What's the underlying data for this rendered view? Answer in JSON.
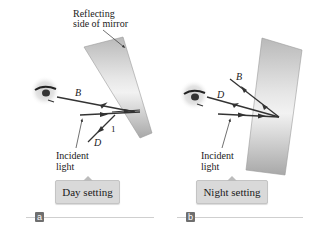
{
  "figure": {
    "panels": [
      {
        "id": "a",
        "letter": "a",
        "setting_label": "Day setting",
        "mirror_label_line1": "Reflecting",
        "mirror_label_line2": "side of mirror",
        "ray_labels": {
          "upper": "B",
          "lower": "D",
          "marker": "1"
        },
        "incident_label_line1": "Incident",
        "incident_label_line2": "light"
      },
      {
        "id": "b",
        "letter": "b",
        "setting_label": "Night setting",
        "ray_labels": {
          "upper": "B",
          "lower": "D"
        },
        "incident_label_line1": "Incident",
        "incident_label_line2": "light"
      }
    ],
    "colors": {
      "ray": "#333333",
      "mirror_light": "#e8e8e8",
      "mirror_dark": "#a9a9a9",
      "badge_bg": "#d9d9d9",
      "panel_letter_bg": "#6f6f6f"
    }
  }
}
